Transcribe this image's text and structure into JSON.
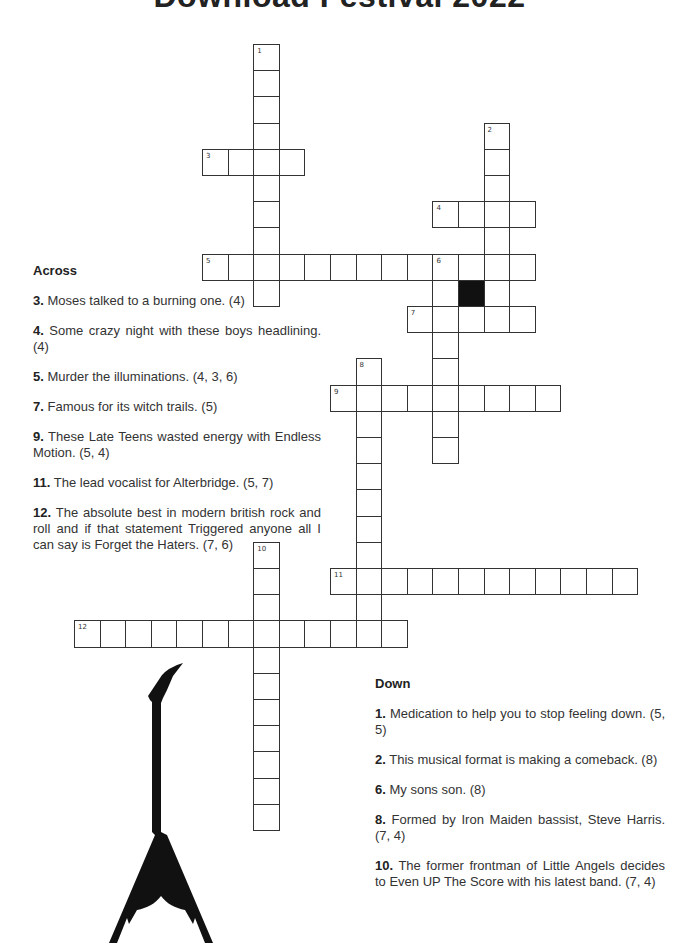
{
  "title": "Download Festival 2022",
  "grid": {
    "origin_x": 74,
    "origin_y": 44,
    "cell_w": 25.6,
    "cell_h": 26.2,
    "black_cells": [
      [
        15,
        9
      ]
    ],
    "entries": [
      {
        "number": 1,
        "direction": "down",
        "col": 7,
        "row": 0,
        "length": 10
      },
      {
        "number": 2,
        "direction": "down",
        "col": 16,
        "row": 3,
        "length": 8
      },
      {
        "number": 3,
        "direction": "across",
        "col": 5,
        "row": 4,
        "length": 4
      },
      {
        "number": 4,
        "direction": "across",
        "col": 14,
        "row": 6,
        "length": 4
      },
      {
        "number": 5,
        "direction": "across",
        "col": 5,
        "row": 8,
        "length": 13
      },
      {
        "number": 6,
        "direction": "down",
        "col": 14,
        "row": 8,
        "length": 8
      },
      {
        "number": 7,
        "direction": "across",
        "col": 13,
        "row": 10,
        "length": 5
      },
      {
        "number": 8,
        "direction": "down",
        "col": 11,
        "row": 12,
        "length": 11
      },
      {
        "number": 9,
        "direction": "across",
        "col": 10,
        "row": 13,
        "length": 9
      },
      {
        "number": 10,
        "direction": "down",
        "col": 7,
        "row": 19,
        "length": 11
      },
      {
        "number": 11,
        "direction": "across",
        "col": 10,
        "row": 20,
        "length": 12
      },
      {
        "number": 12,
        "direction": "across",
        "col": 0,
        "row": 22,
        "length": 13
      }
    ]
  },
  "across": {
    "heading": "Across",
    "clues": [
      {
        "num": "3.",
        "text": " Moses talked to a burning one. (4)"
      },
      {
        "num": "4.",
        "text": " Some crazy night with these boys headlining. (4)"
      },
      {
        "num": "5.",
        "text": " Murder the illuminations. (4, 3, 6)"
      },
      {
        "num": "7.",
        "text": " Famous for its witch trails. (5)"
      },
      {
        "num": "9.",
        "text": " These Late Teens wasted energy with Endless Motion. (5, 4)"
      },
      {
        "num": "11.",
        "text": " The lead vocalist for Alterbridge. (5, 7)"
      },
      {
        "num": "12.",
        "text": " The absolute best in modern british rock and roll and if that statement Triggered anyone all I can say is Forget the Haters. (7, 6)"
      }
    ]
  },
  "down": {
    "heading": "Down",
    "clues": [
      {
        "num": "1.",
        "text": "  Medication to help you to stop feeling down. (5, 5)"
      },
      {
        "num": "2.",
        "text": " This musical format is making a comeback. (8)"
      },
      {
        "num": "6.",
        "text": " My sons son. (8)"
      },
      {
        "num": "8.",
        "text": " Formed by Iron Maiden bassist, Steve Harris. (7, 4)"
      },
      {
        "num": "10.",
        "text": " The former frontman of Little Angels decides to Even UP The Score with his latest band. (7, 4)"
      }
    ]
  },
  "decoration": {
    "icon": "flying-v-guitar-icon",
    "color": "#111111"
  }
}
